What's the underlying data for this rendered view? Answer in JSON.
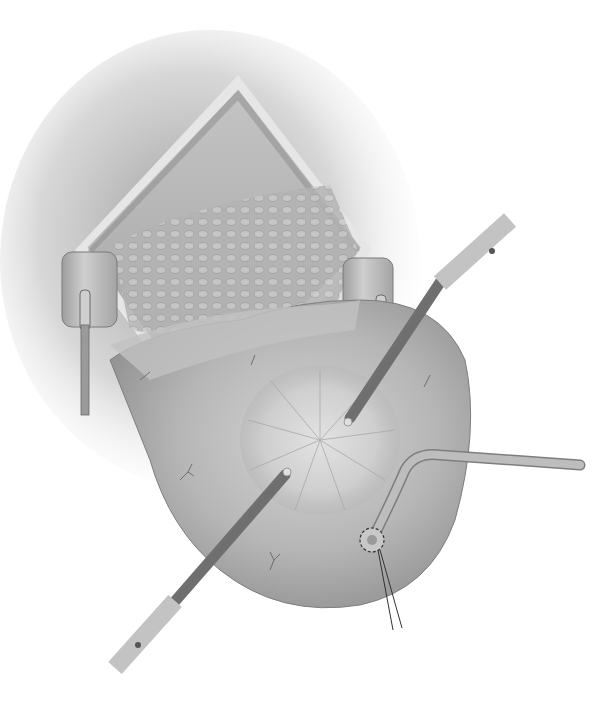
{
  "image": {
    "kind": "surgical illustration",
    "style": "grayscale",
    "width": 599,
    "height": 722
  },
  "colors": {
    "background": "#ffffff",
    "skin_shadow": "#9a9a9a",
    "incision_edge": "#e4e4e4",
    "incision_floor": "#a8a8a8",
    "omentum": "#b8b8b8",
    "organ": "#b4b4b4",
    "organ_highlight": "#cfcfcf",
    "organ_shadow": "#8a8a8a",
    "mucosa": "#d2d2d2",
    "instrument": "#7c7c7c",
    "instrument_tip": "#d8d8d8",
    "tube": "#a6a6a6",
    "suture": "#333333",
    "retractor": "#bdbdbd"
  },
  "elements": {
    "incision": "diamond-shaped skin incision",
    "retractors": [
      "left retractor",
      "right retractor"
    ],
    "organ": "distended organ with radial mucosal folds",
    "instruments": [
      "upper right trocar",
      "lower left trocar"
    ],
    "tube": "catheter entering through purse-string suture",
    "suture": "purse-string suture with two trailing ends"
  }
}
